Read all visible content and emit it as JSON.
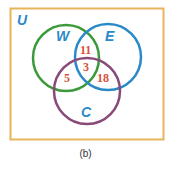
{
  "diagram": {
    "type": "venn",
    "universe": {
      "label": "U",
      "border_color": "#e8b45a",
      "label_color": "#2a8ac8"
    },
    "sets": [
      {
        "label": "W",
        "color": "#3a9a3a",
        "label_color": "#2a8ac8"
      },
      {
        "label": "E",
        "color": "#2a8ac8",
        "label_color": "#2a8ac8"
      },
      {
        "label": "C",
        "color": "#8a4a78",
        "label_color": "#2a8ac8"
      }
    ],
    "regions": [
      {
        "sets": [
          "W",
          "E"
        ],
        "only": true,
        "value": "11"
      },
      {
        "sets": [
          "W",
          "E",
          "C"
        ],
        "value": "3"
      },
      {
        "sets": [
          "W",
          "C"
        ],
        "only": true,
        "value": "5"
      },
      {
        "sets": [
          "E",
          "C"
        ],
        "only": true,
        "value": "18"
      }
    ],
    "number_color": "#d9503a",
    "caption": "(b)"
  }
}
